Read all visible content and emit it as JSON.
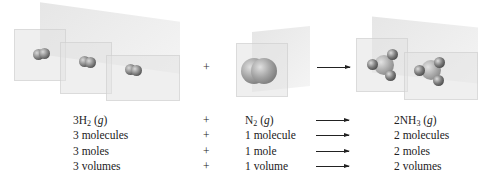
{
  "figure": {
    "illustration": {
      "reactant1": {
        "label": "H2 molecules",
        "count": 3
      },
      "operator": "+",
      "reactant2": {
        "label": "N2 molecule",
        "count": 1
      },
      "arrow": "→",
      "product": {
        "label": "NH3 molecules",
        "count": 2
      }
    },
    "table": {
      "rows": [
        {
          "col1": {
            "coef": "3",
            "formula": "H",
            "sub": "2",
            "state": "g"
          },
          "op": "+",
          "col2": {
            "coef": "",
            "formula": "N",
            "sub": "2",
            "state": "g"
          },
          "col3": {
            "coef": "2",
            "formula": "NH",
            "sub": "3",
            "state": "g"
          }
        },
        {
          "col1_text": "3 molecules",
          "op": "+",
          "col2_text": "1 molecule",
          "col3_text": "2 molecules"
        },
        {
          "col1_text": "3 moles",
          "op": "+",
          "col2_text": "1 mole",
          "col3_text": "2 moles"
        },
        {
          "col1_text": "3 volumes",
          "op": "+",
          "col2_text": "1 volume",
          "col3_text": "2 volumes"
        }
      ]
    }
  }
}
